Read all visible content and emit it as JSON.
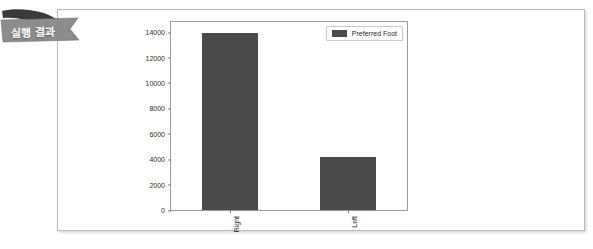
{
  "banner": {
    "label": "실행 결과",
    "fold_color": "#3a3a3a",
    "band_color": "#8c8c8c",
    "text_color": "#ffffff"
  },
  "container": {
    "border_color": "#b9b9b9",
    "background": "#ffffff"
  },
  "chart_data": {
    "type": "bar",
    "title": "",
    "xlabel": "",
    "ylabel": "",
    "categories": [
      "Right",
      "Left"
    ],
    "values": [
      13950,
      4150
    ],
    "series": [
      {
        "name": "Preferred Foot",
        "values": [
          13950,
          4150
        ]
      }
    ],
    "ylim": [
      0,
      14800
    ],
    "yticks": [
      0,
      2000,
      4000,
      6000,
      8000,
      10000,
      12000,
      14000
    ],
    "ytick_labels": [
      "0",
      "2000",
      "4000",
      "6000",
      "8000",
      "10000",
      "12000",
      "14000"
    ],
    "xtick_labels": [
      "Right",
      "Left"
    ],
    "xtick_label_rotation": 90,
    "grid": false,
    "legend": {
      "position": "upper right",
      "entries": [
        {
          "label": "Preferred Foot",
          "color": "#4a4a4a"
        }
      ]
    },
    "bar_color": "#4a4a4a",
    "axes_color": "#9a9a9a",
    "background": "#ffffff"
  }
}
